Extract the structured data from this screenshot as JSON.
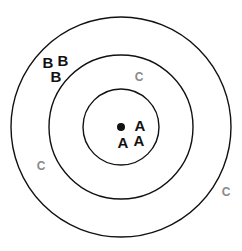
{
  "diagram": {
    "type": "concentric-target",
    "colors": {
      "ring": "#111111",
      "label": "#111111",
      "faded_label": "#8a8a8a",
      "background": "#ffffff"
    },
    "center": {
      "x": 121,
      "y": 127,
      "marker": "filled-dot"
    },
    "rings": [
      {
        "name": "inner",
        "radius": 38
      },
      {
        "name": "middle",
        "radius": 72
      },
      {
        "name": "outer",
        "radius": 110
      }
    ],
    "labels": [
      {
        "text": "A",
        "x": 140,
        "y": 131,
        "group": "A",
        "zone": "inner"
      },
      {
        "text": "A",
        "x": 123,
        "y": 148,
        "group": "A",
        "zone": "inner"
      },
      {
        "text": "A",
        "x": 139,
        "y": 146,
        "group": "A",
        "zone": "inner"
      },
      {
        "text": "B",
        "x": 48,
        "y": 68,
        "group": "B",
        "zone": "between-middle-outer"
      },
      {
        "text": "B",
        "x": 63,
        "y": 66,
        "group": "B",
        "zone": "between-middle-outer"
      },
      {
        "text": "B",
        "x": 56,
        "y": 82,
        "group": "B",
        "zone": "between-middle-outer"
      },
      {
        "text": "C",
        "x": 139,
        "y": 81,
        "group": "C",
        "zone": "between-inner-middle"
      },
      {
        "text": "C",
        "x": 41,
        "y": 170,
        "group": "C",
        "zone": "between-middle-outer"
      },
      {
        "text": "C",
        "x": 226,
        "y": 196,
        "group": "C",
        "zone": "outside-outer"
      }
    ]
  }
}
